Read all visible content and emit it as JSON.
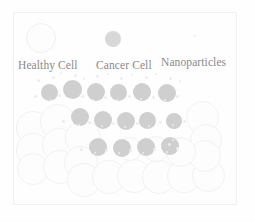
{
  "figure": {
    "width": 255,
    "height": 222,
    "background_color": "#fefefe",
    "frame_color": "#f1f1f1"
  },
  "legend": {
    "items": [
      {
        "id": "healthy-cell",
        "label": "Healthy Cell",
        "swatch_type": "circle-outline",
        "swatch_fill": "#fdfdfd",
        "swatch_stroke": "#f0f0f0",
        "swatch_x": 26,
        "swatch_y": 23,
        "swatch_size": 30,
        "label_x": 18,
        "label_y": 60
      },
      {
        "id": "cancer-cell",
        "label": "Cancer Cell",
        "swatch_type": "circle-filled",
        "swatch_fill": "#d8d8d8",
        "swatch_stroke": "#d8d8d8",
        "swatch_x": 105,
        "swatch_y": 31,
        "swatch_size": 16,
        "label_x": 96,
        "label_y": 60
      },
      {
        "id": "nanoparticles",
        "label": "Nanoparticles",
        "swatch_type": "dot",
        "swatch_fill": "#f3f3f3",
        "swatch_stroke": "#f3f3f3",
        "swatch_x": 193,
        "swatch_y": 34,
        "swatch_size": 3,
        "label_x": 161,
        "label_y": 57
      }
    ]
  },
  "cluster": {
    "healthy_cells": [
      {
        "x": 16,
        "y": 111,
        "d": 34
      },
      {
        "x": 16,
        "y": 133,
        "d": 34
      },
      {
        "x": 17,
        "y": 153,
        "d": 32
      },
      {
        "x": 40,
        "y": 104,
        "d": 36
      },
      {
        "x": 42,
        "y": 128,
        "d": 34
      },
      {
        "x": 43,
        "y": 150,
        "d": 34
      },
      {
        "x": 65,
        "y": 120,
        "d": 36
      },
      {
        "x": 64,
        "y": 146,
        "d": 34
      },
      {
        "x": 67,
        "y": 163,
        "d": 34
      },
      {
        "x": 92,
        "y": 160,
        "d": 34
      },
      {
        "x": 117,
        "y": 159,
        "d": 34
      },
      {
        "x": 142,
        "y": 160,
        "d": 34
      },
      {
        "x": 167,
        "y": 159,
        "d": 34
      },
      {
        "x": 192,
        "y": 159,
        "d": 33
      },
      {
        "x": 186,
        "y": 101,
        "d": 33
      },
      {
        "x": 190,
        "y": 124,
        "d": 32
      },
      {
        "x": 189,
        "y": 140,
        "d": 32
      },
      {
        "x": 166,
        "y": 137,
        "d": 30
      },
      {
        "x": 143,
        "y": 136,
        "d": 26
      },
      {
        "x": 118,
        "y": 137,
        "d": 24
      }
    ],
    "cancer_cells": [
      {
        "x": 41,
        "y": 84,
        "d": 17
      },
      {
        "x": 63,
        "y": 80,
        "d": 19
      },
      {
        "x": 87,
        "y": 83,
        "d": 18
      },
      {
        "x": 110,
        "y": 84,
        "d": 17
      },
      {
        "x": 133,
        "y": 83,
        "d": 18
      },
      {
        "x": 158,
        "y": 84,
        "d": 18
      },
      {
        "x": 71,
        "y": 108,
        "d": 18
      },
      {
        "x": 94,
        "y": 111,
        "d": 18
      },
      {
        "x": 117,
        "y": 112,
        "d": 18
      },
      {
        "x": 139,
        "y": 112,
        "d": 17
      },
      {
        "x": 166,
        "y": 113,
        "d": 16
      },
      {
        "x": 89,
        "y": 138,
        "d": 18
      },
      {
        "x": 113,
        "y": 139,
        "d": 18
      },
      {
        "x": 137,
        "y": 138,
        "d": 18
      },
      {
        "x": 161,
        "y": 137,
        "d": 18
      }
    ],
    "nanoparticles": [
      {
        "x": 37,
        "y": 79,
        "d": 3
      },
      {
        "x": 52,
        "y": 76,
        "d": 3
      },
      {
        "x": 60,
        "y": 72,
        "d": 2
      },
      {
        "x": 74,
        "y": 74,
        "d": 3
      },
      {
        "x": 83,
        "y": 78,
        "d": 2
      },
      {
        "x": 96,
        "y": 75,
        "d": 3
      },
      {
        "x": 107,
        "y": 73,
        "d": 2
      },
      {
        "x": 120,
        "y": 77,
        "d": 3
      },
      {
        "x": 131,
        "y": 74,
        "d": 2
      },
      {
        "x": 145,
        "y": 76,
        "d": 3
      },
      {
        "x": 155,
        "y": 73,
        "d": 2
      },
      {
        "x": 169,
        "y": 77,
        "d": 3
      },
      {
        "x": 179,
        "y": 80,
        "d": 2
      },
      {
        "x": 34,
        "y": 95,
        "d": 3
      },
      {
        "x": 50,
        "y": 99,
        "d": 2
      },
      {
        "x": 58,
        "y": 94,
        "d": 3
      },
      {
        "x": 70,
        "y": 98,
        "d": 2
      },
      {
        "x": 81,
        "y": 95,
        "d": 3
      },
      {
        "x": 92,
        "y": 99,
        "d": 2
      },
      {
        "x": 104,
        "y": 96,
        "d": 3
      },
      {
        "x": 116,
        "y": 99,
        "d": 2
      },
      {
        "x": 128,
        "y": 95,
        "d": 3
      },
      {
        "x": 140,
        "y": 98,
        "d": 2
      },
      {
        "x": 152,
        "y": 96,
        "d": 3
      },
      {
        "x": 164,
        "y": 99,
        "d": 2
      },
      {
        "x": 176,
        "y": 95,
        "d": 3
      },
      {
        "x": 62,
        "y": 120,
        "d": 3
      },
      {
        "x": 78,
        "y": 124,
        "d": 2
      },
      {
        "x": 88,
        "y": 121,
        "d": 3
      },
      {
        "x": 101,
        "y": 125,
        "d": 2
      },
      {
        "x": 112,
        "y": 122,
        "d": 3
      },
      {
        "x": 124,
        "y": 126,
        "d": 2
      },
      {
        "x": 136,
        "y": 122,
        "d": 3
      },
      {
        "x": 148,
        "y": 125,
        "d": 2
      },
      {
        "x": 159,
        "y": 121,
        "d": 3
      },
      {
        "x": 172,
        "y": 124,
        "d": 2
      },
      {
        "x": 183,
        "y": 120,
        "d": 3
      },
      {
        "x": 80,
        "y": 148,
        "d": 3
      },
      {
        "x": 94,
        "y": 152,
        "d": 2
      },
      {
        "x": 105,
        "y": 149,
        "d": 3
      },
      {
        "x": 118,
        "y": 152,
        "d": 2
      },
      {
        "x": 129,
        "y": 149,
        "d": 3
      },
      {
        "x": 142,
        "y": 152,
        "d": 2
      },
      {
        "x": 153,
        "y": 148,
        "d": 3
      },
      {
        "x": 166,
        "y": 151,
        "d": 2
      },
      {
        "x": 176,
        "y": 147,
        "d": 3
      },
      {
        "x": 168,
        "y": 143,
        "d": 3
      },
      {
        "x": 172,
        "y": 139,
        "d": 2
      }
    ]
  }
}
